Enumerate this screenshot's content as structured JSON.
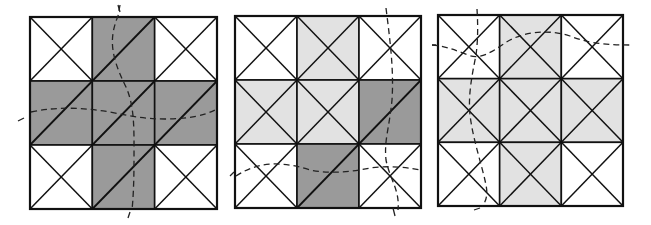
{
  "figure": {
    "width": 651,
    "height": 225,
    "colors": {
      "background": "#ffffff",
      "white": "#ffffff",
      "dark": "#9a9a9a",
      "light": "#e2e2e2",
      "stroke": "#111111",
      "dash": "#222222"
    },
    "panels": [
      {
        "name": "panel-1",
        "x": 30,
        "y": 17,
        "w": 187,
        "h": 192,
        "cells": [
          [
            "white-x",
            "dark-diag",
            "white-x"
          ],
          [
            "dark-diag",
            "dark-diag",
            "dark-diag"
          ],
          [
            "white-x",
            "dark-diag",
            "white-x"
          ]
        ],
        "curves": [
          {
            "name": "vertical-dashed-curve",
            "d": "M 120 5 L 118 16 C 108 40, 112 58, 125 85 C 135 105, 134 130, 134 160 C 134 185, 133 200, 132 210",
            "tick": "M 118 5 L 120 12 M 130 212 L 128 218"
          },
          {
            "name": "horizontal-dashed-curve",
            "d": "M 31 112 C 60 106, 85 108, 110 112 C 130 116, 145 119, 165 119 C 190 119, 205 115, 215 110",
            "tick": "M 18 121 L 24 118"
          }
        ]
      },
      {
        "name": "panel-2",
        "x": 235,
        "y": 16,
        "w": 186,
        "h": 192,
        "cells": [
          [
            "white-x",
            "light-x",
            "white-x"
          ],
          [
            "light-x",
            "light-x",
            "dark-diag"
          ],
          [
            "white-x",
            "dark-diag",
            "white-x"
          ]
        ],
        "curves": [
          {
            "name": "vertical-dashed-curve",
            "d": "M 386 8 C 390 40, 394 70, 392 100 C 389 130, 384 140, 386 160 C 390 180, 400 190, 398 210",
            "tick": "M 393 208 L 395 216"
          },
          {
            "name": "horizontal-dashed-curve",
            "d": "M 236 176 C 260 160, 285 162, 310 170 C 330 174, 350 172, 370 168 C 390 165, 410 168, 421 170",
            "tick": "M 230 176 L 234 172"
          }
        ]
      },
      {
        "name": "panel-3",
        "x": 438,
        "y": 15,
        "w": 185,
        "h": 191,
        "cells": [
          [
            "white-x",
            "light-x",
            "white-x"
          ],
          [
            "light-x",
            "light-x",
            "light-x"
          ],
          [
            "white-x",
            "light-x",
            "white-x"
          ]
        ],
        "curves": [
          {
            "name": "vertical-dashed-curve",
            "d": "M 477 9 C 478 25, 478 40, 476 55 C 472 75, 468 95, 470 115 C 473 140, 482 165, 486 185 C 488 195, 486 202, 482 206",
            "tick": "M 474 210 L 480 208"
          },
          {
            "name": "horizontal-dashed-curve",
            "d": "M 432 45 C 445 46, 455 50, 468 55 C 480 60, 492 52, 505 43 C 520 33, 545 28, 570 36 C 585 42, 600 45, 632 45",
            "tick": "M 432 45 L 436 45"
          }
        ]
      }
    ]
  }
}
